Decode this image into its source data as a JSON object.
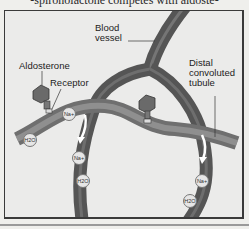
{
  "caption": "-spironolactone competes with aldoste-",
  "diagram": {
    "labels": {
      "blood_vessel": [
        "Blood",
        "vessel"
      ],
      "aldosterone": "Aldosterone",
      "receptor": "Receptor",
      "distal_tubule": [
        "Distal",
        "convoluted",
        "tubule"
      ]
    },
    "ions": {
      "na": "Na+",
      "h2o": "H2O"
    },
    "colors": {
      "vessel": "#5a5a5a",
      "vessel_highlight": "#8a8a8a",
      "tubule": "#7c7c7c",
      "background": "#ebebea",
      "hormone": "#6e6e6e"
    }
  }
}
